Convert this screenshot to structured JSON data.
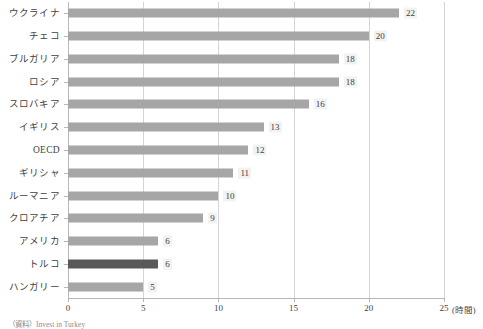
{
  "chart_data": {
    "type": "bar",
    "orientation": "horizontal",
    "title": "",
    "xlabel": "(時間)",
    "ylabel": "",
    "xlim": [
      0,
      25
    ],
    "xticks": [
      "0",
      "5",
      "10",
      "15",
      "20",
      "25"
    ],
    "grid": true,
    "legend": "none",
    "categories": [
      "ウクライナ",
      "チェコ",
      "ブルガリア",
      "ロシア",
      "スロバキア",
      "イギリス",
      "OECD",
      "ギリシャ",
      "ルーマニア",
      "クロアチア",
      "アメリカ",
      "トルコ",
      "ハンガリー"
    ],
    "values": [
      22,
      20,
      18,
      18,
      16,
      13,
      12,
      11,
      10,
      9,
      6,
      6,
      5
    ],
    "data_labels": [
      "22",
      "20",
      "18",
      "18",
      "16",
      "13",
      "12",
      "11",
      "10",
      "9",
      "6",
      "6",
      "5"
    ],
    "highlighted_category": "トルコ",
    "colors": {
      "bar": "#a6a6a6",
      "bar_highlight": "#595959",
      "axis": "#b7b7b7",
      "gridline": "#d4d4d4",
      "label_background": "#f2f2f2",
      "text": "#3f3f3f"
    }
  },
  "footer": {
    "source": "（資料）Invest in Turkey"
  }
}
